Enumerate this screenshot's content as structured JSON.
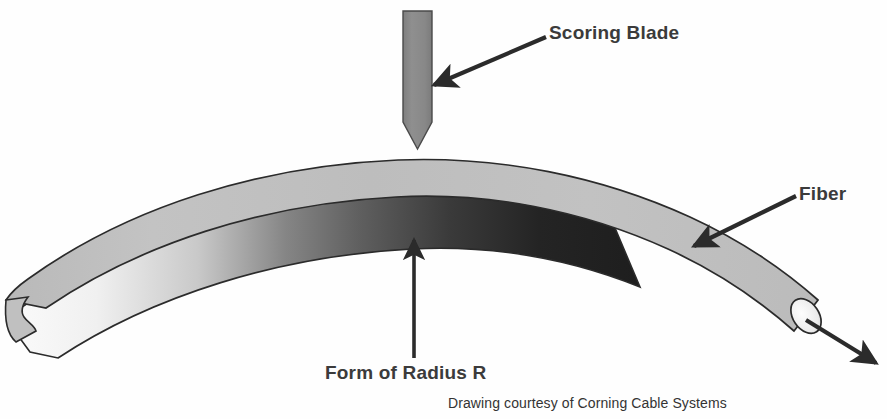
{
  "diagram": {
    "background_color": "#fefefe",
    "width": 887,
    "height": 419,
    "labels": {
      "scoring_blade": "Scoring Blade",
      "fiber": "Fiber",
      "form_of_radius": "Form of Radius R",
      "credit": "Drawing courtesy of Corning Cable Systems"
    },
    "colors": {
      "blade_fill": "#8a8a8a",
      "blade_stroke": "#4a4a4a",
      "fiber_light": "#c6c6c6",
      "fiber_mid": "#b0b0b0",
      "form_light": "#ededed",
      "form_mid": "#6e6e6e",
      "form_dark": "#262626",
      "outline": "#2b2b2b",
      "text": "#3b3b3b",
      "arrow": "#2b2b2b",
      "fiber_endface": "#f2f2f2"
    },
    "parts": [
      {
        "name": "scoring-blade",
        "description": "Vertical gray blade with pointed tip pressing down from top"
      },
      {
        "name": "fiber",
        "description": "Light gray curved band arcing left to right, ending in round cut face"
      },
      {
        "name": "form",
        "description": "Curved form band below the fiber, light on left darkening to black on right"
      },
      {
        "name": "fiber-end-face",
        "description": "White elliptical cleaved end face of the fiber"
      },
      {
        "name": "form-left-notch",
        "description": "V-shaped notch at the left end of the form"
      }
    ],
    "annotations": [
      {
        "name": "scoring-blade-arrow",
        "points_to": "blade shaft",
        "from": [
          545,
          38
        ],
        "to": [
          430,
          86
        ]
      },
      {
        "name": "fiber-arrow",
        "points_to": "fiber band",
        "from": [
          795,
          196
        ],
        "to": [
          690,
          247
        ]
      },
      {
        "name": "form-radius-arrow",
        "points_to": "underside of form apex",
        "from": [
          414,
          358
        ],
        "to": [
          414,
          234
        ]
      },
      {
        "name": "fiber-exit-arrow",
        "points_to": "away from fiber end face",
        "from": [
          815,
          328
        ],
        "to": [
          878,
          366
        ]
      }
    ]
  }
}
